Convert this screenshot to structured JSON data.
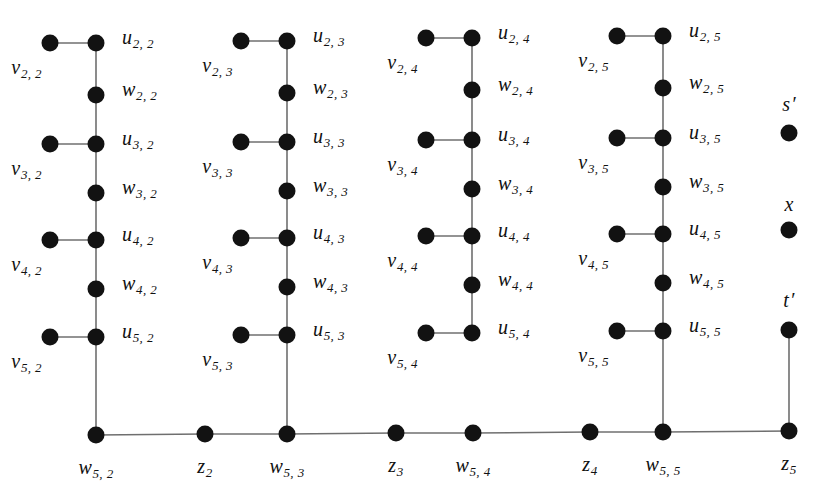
{
  "figure": {
    "type": "graph-diagram",
    "background_color": "#ffffff",
    "node_color": "#121212",
    "edge_color": "#6f6f6f",
    "node_radius": 8.5,
    "width": 822,
    "height": 504
  },
  "columns": [
    {
      "index": 2,
      "axis_x": 96,
      "pendant_x": 50,
      "bottom_label": {
        "base": "w",
        "sub": "5, 2"
      },
      "bottom_x": 96,
      "rows": [
        {
          "u": {
            "base": "u",
            "sub": "2, 2"
          },
          "u_x": 96,
          "u_y": 43,
          "v": {
            "base": "v",
            "sub": "2, 2"
          },
          "v_x": 50,
          "v_y": 43,
          "w": {
            "base": "w",
            "sub": "2, 2"
          },
          "w_x": 96,
          "w_y": 95
        },
        {
          "u": {
            "base": "u",
            "sub": "3, 2"
          },
          "u_x": 96,
          "u_y": 144,
          "v": {
            "base": "v",
            "sub": "3, 2"
          },
          "v_x": 50,
          "v_y": 144,
          "w": {
            "base": "w",
            "sub": "3, 2"
          },
          "w_x": 96,
          "w_y": 193
        },
        {
          "u": {
            "base": "u",
            "sub": "4, 2"
          },
          "u_x": 96,
          "u_y": 240,
          "v": {
            "base": "v",
            "sub": "4, 2"
          },
          "v_x": 50,
          "v_y": 240,
          "w": {
            "base": "w",
            "sub": "4, 2"
          },
          "w_x": 96,
          "w_y": 289
        },
        {
          "u": {
            "base": "u",
            "sub": "5, 2"
          },
          "u_x": 96,
          "u_y": 337,
          "v": {
            "base": "v",
            "sub": "5, 2"
          },
          "v_x": 50,
          "v_y": 337
        }
      ]
    },
    {
      "index": 3,
      "axis_x": 287,
      "pendant_x": 241,
      "bottom_label": {
        "base": "w",
        "sub": "5, 3"
      },
      "bottom_x": 287,
      "rows": [
        {
          "u": {
            "base": "u",
            "sub": "2, 3"
          },
          "u_x": 287,
          "u_y": 41,
          "v": {
            "base": "v",
            "sub": "2, 3"
          },
          "v_x": 241,
          "v_y": 41,
          "w": {
            "base": "w",
            "sub": "2, 3"
          },
          "w_x": 287,
          "w_y": 93
        },
        {
          "u": {
            "base": "u",
            "sub": "3, 3"
          },
          "u_x": 287,
          "u_y": 142,
          "v": {
            "base": "v",
            "sub": "3, 3"
          },
          "v_x": 241,
          "v_y": 142,
          "w": {
            "base": "w",
            "sub": "3, 3"
          },
          "w_x": 287,
          "w_y": 191
        },
        {
          "u": {
            "base": "u",
            "sub": "4, 3"
          },
          "u_x": 287,
          "u_y": 238,
          "v": {
            "base": "v",
            "sub": "4, 3"
          },
          "v_x": 241,
          "v_y": 238,
          "w": {
            "base": "w",
            "sub": "4, 3"
          },
          "w_x": 287,
          "w_y": 287
        },
        {
          "u": {
            "base": "u",
            "sub": "5, 3"
          },
          "u_x": 287,
          "u_y": 335,
          "v": {
            "base": "v",
            "sub": "5, 3"
          },
          "v_x": 241,
          "v_y": 335
        }
      ]
    },
    {
      "index": 4,
      "axis_x": 472,
      "pendant_x": 426,
      "bottom_label": {
        "base": "w",
        "sub": "5, 4"
      },
      "bottom_x": 472,
      "rows": [
        {
          "u": {
            "base": "u",
            "sub": "2, 4"
          },
          "u_x": 472,
          "u_y": 38,
          "v": {
            "base": "v",
            "sub": "2, 4"
          },
          "v_x": 426,
          "v_y": 38,
          "w": {
            "base": "w",
            "sub": "2, 4"
          },
          "w_x": 472,
          "w_y": 90
        },
        {
          "u": {
            "base": "u",
            "sub": "3, 4"
          },
          "u_x": 472,
          "u_y": 140,
          "v": {
            "base": "v",
            "sub": "3, 4"
          },
          "v_x": 426,
          "v_y": 140,
          "w": {
            "base": "w",
            "sub": "3, 4"
          },
          "w_x": 472,
          "w_y": 189
        },
        {
          "u": {
            "base": "u",
            "sub": "4, 4"
          },
          "u_x": 472,
          "u_y": 236,
          "v": {
            "base": "v",
            "sub": "4, 4"
          },
          "v_x": 426,
          "v_y": 236,
          "w": {
            "base": "w",
            "sub": "4, 4"
          },
          "w_x": 472,
          "w_y": 285
        },
        {
          "u": {
            "base": "u",
            "sub": "5, 4"
          },
          "u_x": 472,
          "u_y": 333,
          "v": {
            "base": "v",
            "sub": "5, 4"
          },
          "v_x": 426,
          "v_y": 333
        }
      ]
    },
    {
      "index": 5,
      "axis_x": 663,
      "pendant_x": 617,
      "bottom_label": {
        "base": "w",
        "sub": "5, 5"
      },
      "bottom_x": 663,
      "rows": [
        {
          "u": {
            "base": "u",
            "sub": "2, 5"
          },
          "u_x": 663,
          "u_y": 36,
          "v": {
            "base": "v",
            "sub": "2, 5"
          },
          "v_x": 617,
          "v_y": 36,
          "w": {
            "base": "w",
            "sub": "2, 5"
          },
          "w_x": 663,
          "w_y": 88
        },
        {
          "u": {
            "base": "u",
            "sub": "3, 5"
          },
          "u_x": 663,
          "u_y": 138,
          "v": {
            "base": "v",
            "sub": "3, 5"
          },
          "v_x": 617,
          "v_y": 138,
          "w": {
            "base": "w",
            "sub": "3, 5"
          },
          "w_x": 663,
          "w_y": 187
        },
        {
          "u": {
            "base": "u",
            "sub": "4, 5"
          },
          "u_x": 663,
          "u_y": 234,
          "v": {
            "base": "v",
            "sub": "4, 5"
          },
          "v_x": 617,
          "v_y": 234,
          "w": {
            "base": "w",
            "sub": "4, 5"
          },
          "w_x": 663,
          "w_y": 283
        },
        {
          "u": {
            "base": "u",
            "sub": "5, 5"
          },
          "u_x": 663,
          "u_y": 331,
          "v": {
            "base": "v",
            "sub": "5, 5"
          },
          "v_x": 617,
          "v_y": 331
        }
      ]
    }
  ],
  "bottom_path": {
    "nodes": [
      {
        "id": "w5_2",
        "label": {
          "base": "w",
          "sub": "5, 2"
        },
        "x": 96,
        "y": 435
      },
      {
        "id": "z2",
        "label": {
          "base": "z",
          "sub": "2"
        },
        "x": 205,
        "y": 434
      },
      {
        "id": "w5_3",
        "label": {
          "base": "w",
          "sub": "5, 3"
        },
        "x": 287,
        "y": 434
      },
      {
        "id": "z3",
        "label": {
          "base": "z",
          "sub": "3"
        },
        "x": 396,
        "y": 433
      },
      {
        "id": "w5_4",
        "label": {
          "base": "w",
          "sub": "5, 4"
        },
        "x": 473,
        "y": 433
      },
      {
        "id": "z4",
        "label": {
          "base": "z",
          "sub": "4"
        },
        "x": 590,
        "y": 432
      },
      {
        "id": "w5_5",
        "label": {
          "base": "w",
          "sub": "5, 5"
        },
        "x": 663,
        "y": 432
      },
      {
        "id": "z5",
        "label": {
          "base": "z",
          "sub": "5"
        },
        "x": 789,
        "y": 431
      }
    ]
  },
  "right_column": {
    "x": 789,
    "nodes": [
      {
        "id": "s_prime",
        "label": {
          "base": "s",
          "prime": "′"
        },
        "x": 789,
        "y": 133,
        "label_y": 104,
        "connected_down": false
      },
      {
        "id": "x",
        "label": {
          "base": "x"
        },
        "x": 789,
        "y": 230,
        "label_y": 204,
        "connected_down": false
      },
      {
        "id": "t_prime",
        "label": {
          "base": "t",
          "prime": "′"
        },
        "x": 789,
        "y": 330,
        "label_y": 300,
        "connected_down": true
      }
    ]
  },
  "label_offsets": {
    "u_label_dx": 26,
    "u_label_dy": -4,
    "v_label_dx": -8,
    "v_label_dy": 26,
    "w_label_dx": 26,
    "w_label_dy": -4,
    "bottom_label_dy": 34
  }
}
